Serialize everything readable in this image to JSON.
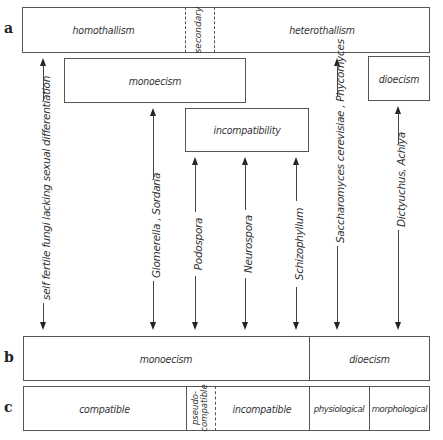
{
  "row_labels": {
    "a": "a",
    "b": "b",
    "c": "c"
  },
  "row_a": {
    "homothallism": "homothallism",
    "secondary": "secondary",
    "heterothallism": "heterothallism"
  },
  "middle_boxes": {
    "monoecism": "monoecism",
    "dioecism": "dioecism",
    "incompatibility": "incompatibility"
  },
  "arrows": [
    {
      "label": "self fertile fungi lacking sexual differentiation",
      "x": 43
    },
    {
      "label": "Glomerella , Sordaria",
      "x": 153
    },
    {
      "label": "Podospora",
      "x": 195
    },
    {
      "label": "Neurospora",
      "x": 245
    },
    {
      "label": "Schizophyllum",
      "x": 296
    },
    {
      "label": "Saccharomyces cerevisiae , Phycomyces",
      "x": 337
    },
    {
      "label": "Dictyuchus, Achlya",
      "x": 398
    }
  ],
  "row_b": {
    "monoecism": "monoecism",
    "dioecism": "dioecism"
  },
  "row_c": {
    "compatible": "compatible",
    "pseudo_compatible_line1": "pseudo-",
    "pseudo_compatible_line2": "compatible",
    "incompatible": "incompatible",
    "physiological": "physiological",
    "morphological": "morphological"
  }
}
